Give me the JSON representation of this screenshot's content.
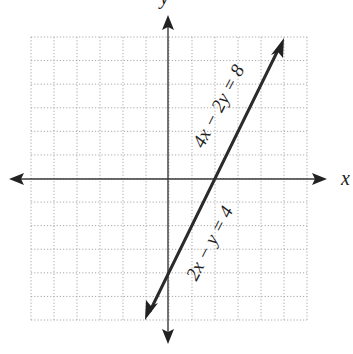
{
  "chart_data": {
    "type": "line",
    "title": "",
    "xlabel": "x",
    "ylabel": "y",
    "xlim": [
      -6,
      6
    ],
    "ylim": [
      -6,
      6
    ],
    "grid": true,
    "tick_labels": false,
    "series": [
      {
        "name": "2x − y = 4 / 4x − 2y = 8",
        "equation": "y = 2x - 4",
        "slope": 2,
        "intercept": -4,
        "x": [
          -1,
          0,
          2,
          5
        ],
        "y": [
          -6,
          -4,
          0,
          6
        ]
      }
    ],
    "annotations": [
      {
        "text": "4x − 2y = 8",
        "position": "along line, upper part (above x-axis)"
      },
      {
        "text": "2x − y = 4",
        "position": "along line, lower part (below x-axis)"
      }
    ]
  },
  "labels": {
    "x_axis": "x",
    "y_axis": "y",
    "eq_upper": "4x − 2y = 8",
    "eq_lower": "2x − y = 4"
  },
  "colors": {
    "line": "#2b2b2b",
    "axes": "#3a3a3a",
    "grid": "#a8a8a8",
    "background": "#ffffff"
  }
}
